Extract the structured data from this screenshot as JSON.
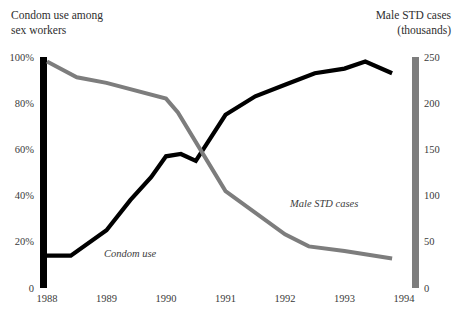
{
  "chart_data": {
    "type": "line",
    "title": "",
    "axes": {
      "x": {
        "label": "",
        "tick_labels": [
          "1988",
          "1989",
          "1990",
          "1991",
          "1992",
          "1993",
          "1994"
        ],
        "range": [
          1988,
          1994
        ]
      },
      "y_left": {
        "title": "Condom use among\nsex workers",
        "tick_labels": [
          "100%",
          "80%",
          "60%",
          "40%",
          "20%",
          "0"
        ],
        "tick_values": [
          100,
          80,
          60,
          40,
          20,
          0
        ],
        "range": [
          0,
          100
        ],
        "unit": "percent",
        "color": "#000000"
      },
      "y_right": {
        "title": "Male STD cases\n(thousands)",
        "tick_labels": [
          "250",
          "200",
          "150",
          "100",
          "50",
          "0"
        ],
        "tick_values": [
          250,
          200,
          150,
          100,
          50,
          0
        ],
        "range": [
          0,
          250
        ],
        "unit": "thousands",
        "color": "#7d7d7d"
      }
    },
    "grid": false,
    "legend": "inline-annotations",
    "series": [
      {
        "name": "Condom use",
        "axis": "y_left",
        "color": "#000000",
        "label_annotation": "Condom use",
        "x": [
          1988.0,
          1988.4,
          1989.0,
          1989.4,
          1989.75,
          1990.0,
          1990.25,
          1990.5,
          1991.0,
          1991.5,
          1992.0,
          1992.5,
          1993.0,
          1993.35,
          1993.8
        ],
        "values": [
          14,
          14,
          25,
          38,
          48,
          57,
          58,
          55,
          75,
          83,
          88,
          93,
          95,
          98,
          93
        ]
      },
      {
        "name": "Male STD cases",
        "axis": "y_right",
        "color": "#7d7d7d",
        "label_annotation": "Male STD cases",
        "x": [
          1988.0,
          1988.5,
          1989.0,
          1990.0,
          1990.2,
          1991.0,
          1992.0,
          1992.4,
          1993.0,
          1993.8
        ],
        "values": [
          245,
          228,
          222,
          205,
          190,
          105,
          58,
          45,
          40,
          32
        ]
      }
    ]
  },
  "labels": {
    "left_axis_title": "Condom use among\nsex workers",
    "right_axis_title": "Male STD cases\n(thousands)",
    "series_condom_use": "Condom use",
    "series_male_std": "Male STD cases",
    "y_left_ticks": [
      "100%",
      "80%",
      "60%",
      "40%",
      "20%",
      "0"
    ],
    "y_right_ticks": [
      "250",
      "200",
      "150",
      "100",
      "50",
      "0"
    ],
    "x_ticks": [
      "1988",
      "1989",
      "1990",
      "1991",
      "1992",
      "1993",
      "1994"
    ]
  },
  "colors": {
    "black_series": "#000000",
    "gray_series": "#7d7d7d",
    "text": "#2e2e2e",
    "background": "#ffffff"
  }
}
